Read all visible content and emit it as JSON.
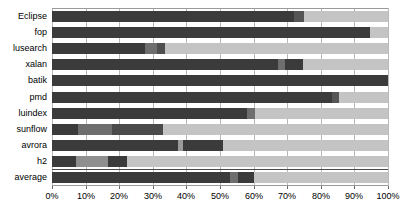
{
  "chart_data": {
    "type": "bar",
    "orientation": "horizontal",
    "stacked": true,
    "normalized": true,
    "title": "",
    "xlabel": "",
    "ylabel": "",
    "xlim": [
      0,
      100
    ],
    "grid": true,
    "legend": "none",
    "categories": [
      "Eclipse",
      "fop",
      "lusearch",
      "xalan",
      "batik",
      "pmd",
      "luindex",
      "sunflow",
      "avrora",
      "h2",
      "average"
    ],
    "xtick_labels": [
      "0%",
      "10%",
      "20%",
      "30%",
      "40%",
      "50%",
      "60%",
      "70%",
      "80%",
      "90%",
      "100%"
    ],
    "xtick_values": [
      0,
      10,
      20,
      30,
      40,
      50,
      60,
      70,
      80,
      90,
      100
    ],
    "colors": {
      "dark": "#3b3b3b",
      "mid_dark": "#555555",
      "mid": "#777777",
      "light": "#c4c4c4"
    },
    "rows": [
      {
        "category": "Eclipse",
        "segments": [
          {
            "value": 72.0,
            "color": "#3b3b3b"
          },
          {
            "value": 3.0,
            "color": "#555555"
          },
          {
            "value": 25.0,
            "color": "#c4c4c4"
          }
        ]
      },
      {
        "category": "fop",
        "segments": [
          {
            "value": 94.6,
            "color": "#3b3b3b"
          },
          {
            "value": 5.4,
            "color": "#c4c4c4"
          }
        ]
      },
      {
        "category": "lusearch",
        "segments": [
          {
            "value": 27.7,
            "color": "#3b3b3b"
          },
          {
            "value": 3.6,
            "color": "#6e6e6e"
          },
          {
            "value": 2.4,
            "color": "#4f4f4f"
          },
          {
            "value": 66.3,
            "color": "#c4c4c4"
          }
        ]
      },
      {
        "category": "xalan",
        "segments": [
          {
            "value": 67.3,
            "color": "#3b3b3b"
          },
          {
            "value": 2.1,
            "color": "#6e6e6e"
          },
          {
            "value": 5.3,
            "color": "#3b3b3b"
          },
          {
            "value": 25.3,
            "color": "#c4c4c4"
          }
        ]
      },
      {
        "category": "batik",
        "segments": [
          {
            "value": 100.0,
            "color": "#3b3b3b"
          }
        ]
      },
      {
        "category": "pmd",
        "segments": [
          {
            "value": 83.3,
            "color": "#3b3b3b"
          },
          {
            "value": 2.1,
            "color": "#555555"
          },
          {
            "value": 14.6,
            "color": "#c4c4c4"
          }
        ]
      },
      {
        "category": "luindex",
        "segments": [
          {
            "value": 58.0,
            "color": "#3b3b3b"
          },
          {
            "value": 2.4,
            "color": "#6e6e6e"
          },
          {
            "value": 39.6,
            "color": "#c4c4c4"
          }
        ]
      },
      {
        "category": "sunflow",
        "segments": [
          {
            "value": 7.7,
            "color": "#3b3b3b"
          },
          {
            "value": 10.2,
            "color": "#6e6e6e"
          },
          {
            "value": 15.1,
            "color": "#4a4a4a"
          },
          {
            "value": 67.0,
            "color": "#c4c4c4"
          }
        ]
      },
      {
        "category": "avrora",
        "segments": [
          {
            "value": 37.5,
            "color": "#3b3b3b"
          },
          {
            "value": 1.5,
            "color": "#9a9a9a"
          },
          {
            "value": 11.9,
            "color": "#3b3b3b"
          },
          {
            "value": 49.1,
            "color": "#c4c4c4"
          }
        ]
      },
      {
        "category": "h2",
        "segments": [
          {
            "value": 7.1,
            "color": "#3b3b3b"
          },
          {
            "value": 9.5,
            "color": "#8f8f8f"
          },
          {
            "value": 5.7,
            "color": "#3b3b3b"
          },
          {
            "value": 77.7,
            "color": "#c4c4c4"
          }
        ]
      },
      {
        "category": "average",
        "segments": [
          {
            "value": 53.0,
            "color": "#3b3b3b"
          },
          {
            "value": 2.4,
            "color": "#6e6e6e"
          },
          {
            "value": 4.8,
            "color": "#3b3b3b"
          },
          {
            "value": 39.8,
            "color": "#c4c4c4"
          }
        ]
      }
    ]
  }
}
